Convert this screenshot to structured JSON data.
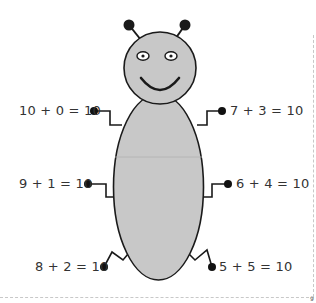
{
  "worksheet": {
    "colors": {
      "body_fill": "#c8c8c8",
      "outline": "#1a1a1a",
      "text": "#333333",
      "dot": "#111111"
    },
    "equations": {
      "top_left": "10 + 0 = 10",
      "top_right": "7 + 3 = 10",
      "middle_left": "9 + 1 = 10",
      "middle_right": "6 + 4 = 10",
      "bottom_left": "8 + 2 = 10",
      "bottom_right": "5 + 5 = 10"
    },
    "page_number": "9"
  }
}
